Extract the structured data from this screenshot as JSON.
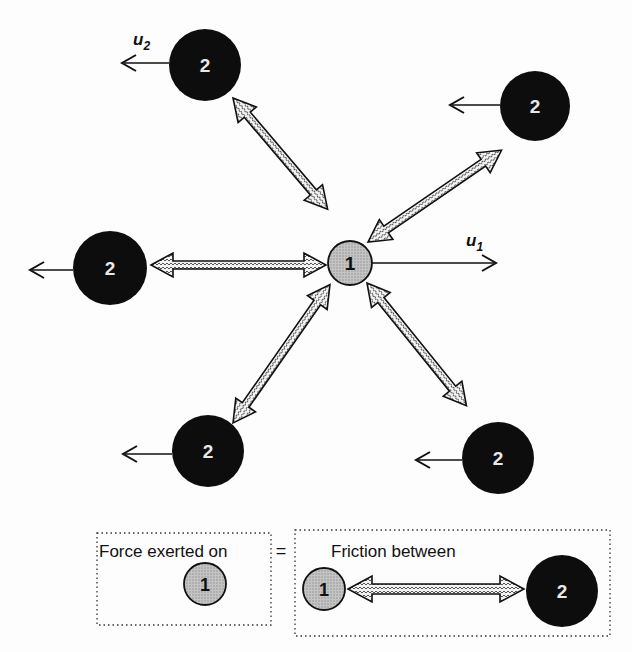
{
  "diagram": {
    "center_particle": {
      "label": "1",
      "cx": 350,
      "cy": 263,
      "r": 22
    },
    "velocity_labels": {
      "u1": "u",
      "u1_sub": "1",
      "u2": "u",
      "u2_sub": "2"
    },
    "outer_particles": [
      {
        "label": "2",
        "cx": 205,
        "cy": 65,
        "r": 36
      },
      {
        "label": "2",
        "cx": 535,
        "cy": 106,
        "r": 35
      },
      {
        "label": "2",
        "cx": 110,
        "cy": 265,
        "r": 37
      },
      {
        "label": "2",
        "cx": 208,
        "cy": 451,
        "r": 36
      },
      {
        "label": "2",
        "cx": 498,
        "cy": 458,
        "r": 36
      }
    ]
  },
  "legend": {
    "left_text": "Force exerted on",
    "equals": "=",
    "right_text": "Friction between",
    "particle1": "1",
    "particle2": "2"
  },
  "colors": {
    "particle2": "#0d0d0d",
    "particle1": "#bdbdbd",
    "arrow_fill": "#e8e8e8",
    "line": "#111111"
  }
}
